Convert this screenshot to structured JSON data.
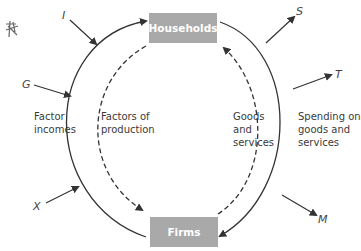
{
  "diagram": {
    "nodes": {
      "households": "Households",
      "firms": "Firms"
    },
    "flow_labels": {
      "factor_incomes_1": "Factor",
      "factor_incomes_2": "incomes",
      "factors_of_production_1": "Factors of",
      "factors_of_production_2": "production",
      "goods_services_1": "Goods",
      "goods_services_2": "and",
      "goods_services_3": "services",
      "spending_1": "Spending on",
      "spending_2": "goods and",
      "spending_3": "services"
    },
    "injections": {
      "investment": "I",
      "government": "G",
      "exports": "X"
    },
    "withdrawals": {
      "savings": "S",
      "taxes": "T",
      "imports": "M"
    },
    "colors": {
      "box_fill": "#a9a9a9",
      "box_text": "#ffffff",
      "line": "#333333"
    }
  }
}
